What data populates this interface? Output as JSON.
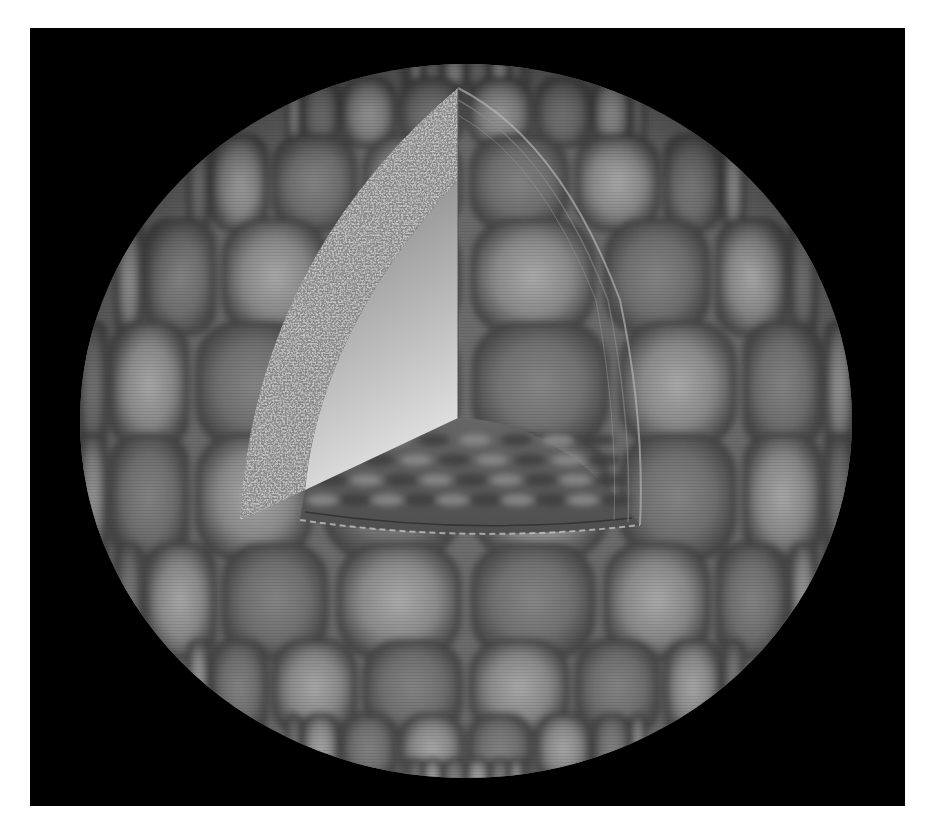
{
  "figure": {
    "background_color": "#000000",
    "page_color": "#ffffff"
  },
  "frame": {
    "x": 30,
    "y": 28,
    "width": 875,
    "height": 778
  },
  "sphere": {
    "cx": 466,
    "cy": 421,
    "rx": 386,
    "ry": 357,
    "base_color": "#7a7a7a",
    "cell_light": "#a2a2a2",
    "cell_dark": "#4a4a4a",
    "rows": 9,
    "cols": 12
  },
  "cutaway": {
    "crust_outer_top": [
      458,
      88
    ],
    "crust_inner_top": [
      458,
      180
    ],
    "crust_bottom_left": [
      240,
      520
    ],
    "inner_corner": [
      458,
      418
    ],
    "wedge_bottom_left": [
      305,
      490
    ],
    "floor_right": [
      640,
      525
    ],
    "crust_color": "#9a9a9a",
    "inner_face_top": "#8c8c8c",
    "inner_face_bottom": "#dcdcdc",
    "floor_color": "#5e5e5e"
  }
}
